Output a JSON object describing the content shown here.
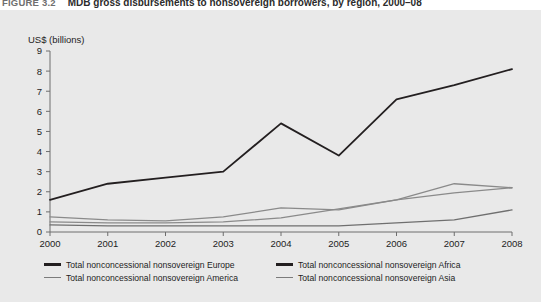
{
  "caption": {
    "number": "FIGURE 3.2",
    "text": "MDB gross disbursements to nonsovereign borrowers, by region, 2000–08"
  },
  "axis": {
    "ylabel": "US$ (billions)",
    "yticks": [
      "0",
      "1",
      "2",
      "3",
      "4",
      "5",
      "6",
      "7",
      "8",
      "9"
    ],
    "xticks": [
      "2000",
      "2001",
      "2002",
      "2003",
      "2004",
      "2005",
      "2006",
      "2007",
      "2008"
    ]
  },
  "legend": {
    "items": [
      {
        "label": "Total nonconcessional nonsovereign Europe",
        "style": "dark"
      },
      {
        "label": "Total nonconcessional nonsovereign Africa",
        "style": "gray"
      },
      {
        "label": "Total nonconcessional nonsovereign America",
        "style": "gray"
      },
      {
        "label": "Total nonconcessional nonsovereign Asia",
        "style": "gray"
      }
    ]
  },
  "colors": {
    "panel_background": "#e9e9e9",
    "plot_background": "#e9e9e9",
    "axis": "#6e6e6e",
    "series_europe": "#231f20",
    "series_america": "#8a8a8a",
    "series_asia": "#8a8a8a",
    "series_africa": "#6f6f6f",
    "text": "#1d1d1d"
  },
  "chart_data": {
    "type": "line",
    "title": "MDB gross disbursements to nonsovereign borrowers, by region, 2000–08",
    "xlabel": "",
    "ylabel": "US$ (billions)",
    "x": [
      2000,
      2001,
      2002,
      2003,
      2004,
      2005,
      2006,
      2007,
      2008
    ],
    "categories": [
      "2000",
      "2001",
      "2002",
      "2003",
      "2004",
      "2005",
      "2006",
      "2007",
      "2008"
    ],
    "ylim": [
      0,
      9
    ],
    "xlim": [
      2000,
      2008
    ],
    "grid": false,
    "legend_position": "below",
    "series": [
      {
        "name": "Total nonconcessional nonsovereign Europe",
        "color": "#231f20",
        "values": [
          1.6,
          2.4,
          2.7,
          3.0,
          5.4,
          3.8,
          6.6,
          7.3,
          8.1
        ]
      },
      {
        "name": "Total nonconcessional nonsovereign America",
        "color": "#8a8a8a",
        "values": [
          0.75,
          0.6,
          0.55,
          0.75,
          1.2,
          1.1,
          1.6,
          2.4,
          2.2
        ]
      },
      {
        "name": "Total nonconcessional nonsovereign Asia",
        "color": "#8a8a8a",
        "values": [
          0.5,
          0.45,
          0.45,
          0.5,
          0.7,
          1.15,
          1.6,
          1.95,
          2.2
        ]
      },
      {
        "name": "Total nonconcessional nonsovereign Africa",
        "color": "#6f6f6f",
        "values": [
          0.35,
          0.3,
          0.3,
          0.3,
          0.3,
          0.3,
          0.45,
          0.6,
          1.1
        ]
      }
    ]
  }
}
